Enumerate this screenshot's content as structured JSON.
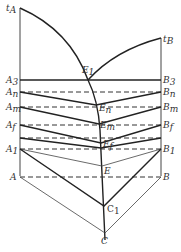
{
  "diagram": {
    "labels": {
      "tA": {
        "main": "t",
        "sub": "A"
      },
      "tB": {
        "main": "t",
        "sub": "B"
      },
      "E1": {
        "main": "E",
        "sub": "1"
      },
      "A3": {
        "main": "A",
        "sub": "3"
      },
      "B3": {
        "main": "B",
        "sub": "3"
      },
      "An": {
        "main": "A",
        "sub": "n"
      },
      "Bn": {
        "main": "B",
        "sub": "n"
      },
      "En": {
        "main": "E",
        "sub": "n"
      },
      "Am": {
        "main": "A",
        "sub": "m"
      },
      "Bm": {
        "main": "B",
        "sub": "m"
      },
      "Em": {
        "main": "E",
        "sub": "m"
      },
      "Af": {
        "main": "A",
        "sub": "f"
      },
      "Bf": {
        "main": "B",
        "sub": "f"
      },
      "Ef": {
        "main": "E",
        "sub": "f"
      },
      "A1": {
        "main": "A",
        "sub": "1"
      },
      "B1": {
        "main": "B",
        "sub": "1"
      },
      "E": {
        "main": "E",
        "sub": ""
      },
      "A": {
        "main": "A",
        "sub": ""
      },
      "B": {
        "main": "B",
        "sub": ""
      },
      "C1": {
        "main": "C",
        "sub": "1"
      },
      "C": {
        "main": "C",
        "sub": ""
      }
    }
  }
}
